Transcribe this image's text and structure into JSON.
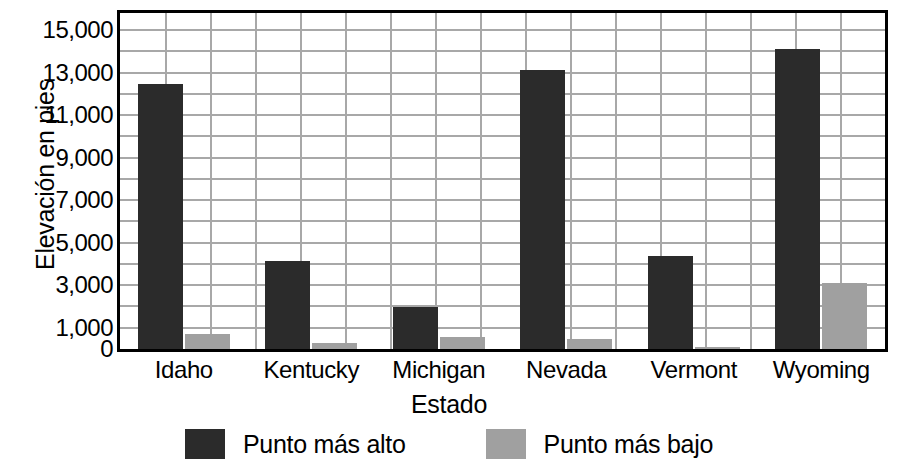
{
  "chart_data": {
    "type": "bar",
    "title": "",
    "xlabel": "Estado",
    "ylabel": "Elevación en pies",
    "categories": [
      "Idaho",
      "Kentucky",
      "Michigan",
      "Nevada",
      "Vermont",
      "Wyoming"
    ],
    "series": [
      {
        "name": "Punto más alto",
        "color": "#2b2b2b",
        "values": [
          12450,
          4140,
          1980,
          13140,
          4395,
          14110
        ]
      },
      {
        "name": "Punto más bajo",
        "color": "#a0a0a0",
        "values": [
          710,
          260,
          570,
          480,
          95,
          3100
        ]
      }
    ],
    "ylim": [
      0,
      15800
    ],
    "ytick_values": [
      0,
      1000,
      3000,
      5000,
      7000,
      9000,
      11000,
      13000,
      15000
    ],
    "ytick_labels": [
      "0",
      "1,000",
      "3,000",
      "5,000",
      "7,000",
      "9,000",
      "11,000",
      "13,000",
      "15,000"
    ],
    "gridlines_horizontal": [
      1000,
      2000,
      3000,
      4000,
      5000,
      6000,
      7000,
      8000,
      9000,
      10000,
      11000,
      12000,
      13000,
      14000,
      15000
    ],
    "grid": true,
    "grid_vertical_count": 17,
    "legend_position": "bottom",
    "legend": [
      "Punto más alto",
      "Punto más bajo"
    ]
  },
  "axes": {
    "y_title": "Elevación en pies",
    "x_title": "Estado"
  },
  "legend": {
    "items": [
      {
        "label": "Punto más alto",
        "swatch": "dark-swatch"
      },
      {
        "label": "Punto más bajo",
        "swatch": "gray-swatch"
      }
    ]
  }
}
